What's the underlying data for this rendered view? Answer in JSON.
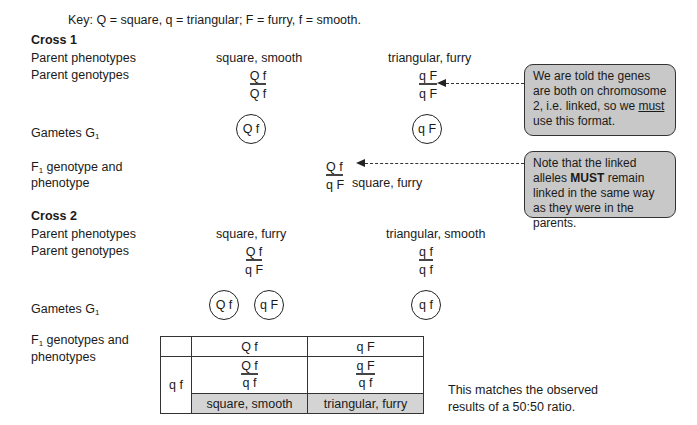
{
  "key": "Key: Q = square, q = triangular; F = furry, f = smooth.",
  "cross1": {
    "heading": "Cross 1",
    "labels": {
      "parent_phenotypes": "Parent phenotypes",
      "parent_genotypes": "Parent genotypes",
      "gametes_prefix": "Gametes G",
      "gametes_sub": "1",
      "f1_line1_prefix": "F",
      "f1_line1_sub": "1",
      "f1_line1_rest": " genotype and",
      "f1_line2": "phenotype"
    },
    "parent1": {
      "phenotype": "square, smooth",
      "genotype_top": "Q f",
      "genotype_bottom": "Q f",
      "gamete": "Q f"
    },
    "parent2": {
      "phenotype": "triangular, furry",
      "genotype_top": "q F",
      "genotype_bottom": "q F",
      "gamete": "q F"
    },
    "f1": {
      "genotype_top": "Q f",
      "genotype_bottom": "q F",
      "phenotype": "square, furry"
    }
  },
  "callouts": {
    "linked": {
      "pre": "We are told the genes are both on chromosome 2, i.e. linked, so we ",
      "emph": "must",
      "post": " use this format."
    },
    "same_way": {
      "pre": "Note that the linked alleles ",
      "emph": "MUST",
      "post": " remain linked in the same way as they were in the parents."
    }
  },
  "cross2": {
    "heading": "Cross 2",
    "labels": {
      "parent_phenotypes": "Parent phenotypes",
      "parent_genotypes": "Parent genotypes",
      "gametes_prefix": "Gametes G",
      "gametes_sub": "1",
      "f1_line1_prefix": "F",
      "f1_line1_sub": "1",
      "f1_line1_rest": " genotypes and",
      "f1_line2": "phenotypes"
    },
    "parent1": {
      "phenotype": "square, furry",
      "genotype_top": "Q f",
      "genotype_bottom": "q F",
      "gametes": [
        "Q f",
        "q F"
      ]
    },
    "parent2": {
      "phenotype": "triangular, smooth",
      "genotype_top": "q f",
      "genotype_bottom": "q f",
      "gametes": [
        "q f"
      ]
    },
    "punnett": {
      "col_headers": [
        "Q f",
        "q F"
      ],
      "row_header": "q f",
      "cells": [
        {
          "genotype_top": "Q f",
          "genotype_bottom": "q f",
          "phenotype": "square, smooth"
        },
        {
          "genotype_top": "q F",
          "genotype_bottom": "q f",
          "phenotype": "triangular, furry"
        }
      ]
    },
    "conclusion_line1": "This matches the observed",
    "conclusion_line2": "results of a 50:50 ratio."
  }
}
